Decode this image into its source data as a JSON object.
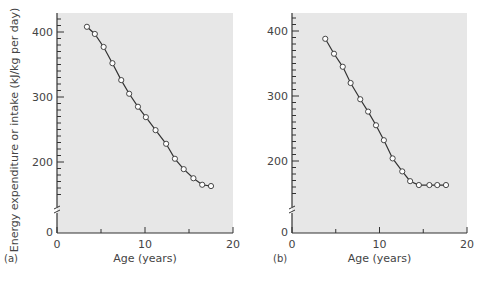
{
  "figure": {
    "ylabel": "Energy expenditure or intake (kJ/kg per day)",
    "xlabel": "Age (years)",
    "y_ticks": [
      "0",
      "200",
      "300",
      "400"
    ],
    "x_ticks": [
      "0",
      "10",
      "20"
    ],
    "colors": {
      "plot_bg": "#e7e7e7",
      "line": "#333333",
      "marker_fill": "#ffffff"
    }
  },
  "chart_data": [
    {
      "type": "line",
      "panel_label": "(a)",
      "title": "",
      "xlabel": "Age (years)",
      "ylabel": "Energy expenditure or intake (kJ/kg per day)",
      "xlim": [
        0,
        20
      ],
      "ylim": [
        0,
        430
      ],
      "axis_break": "between 0 and 200 on y-axis",
      "x_tick_labels": [
        "0",
        "10",
        "20"
      ],
      "y_tick_labels": [
        "0",
        "200",
        "300",
        "400"
      ],
      "grid": false,
      "marker": "open circle",
      "x": [
        3.4,
        4.3,
        5.3,
        6.3,
        7.3,
        8.2,
        9.2,
        10.1,
        11.2,
        12.4,
        13.4,
        14.4,
        15.5,
        16.5,
        17.5
      ],
      "y": [
        408,
        397,
        377,
        352,
        326,
        305,
        285,
        269,
        249,
        228,
        205,
        189,
        175,
        165,
        163
      ]
    },
    {
      "type": "line",
      "panel_label": "(b)",
      "title": "",
      "xlabel": "Age (years)",
      "ylabel": "",
      "xlim": [
        0,
        20
      ],
      "ylim": [
        0,
        430
      ],
      "axis_break": "between 0 and 200 on y-axis",
      "x_tick_labels": [
        "0",
        "10",
        "20"
      ],
      "y_tick_labels": [
        "0",
        "200",
        "300",
        "400"
      ],
      "grid": false,
      "marker": "open circle",
      "x": [
        3.8,
        4.8,
        5.8,
        6.7,
        7.8,
        8.7,
        9.6,
        10.5,
        11.5,
        12.6,
        13.5,
        14.5,
        15.7,
        16.6,
        17.6
      ],
      "y": [
        388,
        365,
        345,
        320,
        295,
        276,
        255,
        232,
        204,
        184,
        169,
        163,
        163,
        163,
        163
      ]
    }
  ]
}
